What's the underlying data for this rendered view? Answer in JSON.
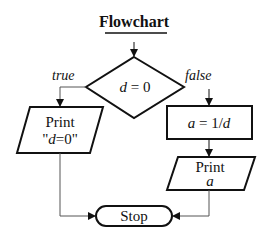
{
  "title": "Flowchart",
  "decision": {
    "expr_var": "d",
    "expr_rest": " = 0",
    "true_label": "true",
    "false_label": "false"
  },
  "left_branch": {
    "line1": "Print",
    "line2_open": "\"",
    "line2_var": "d",
    "line2_rest": "=0\""
  },
  "right_branch": {
    "process_var": "a",
    "process_eq": " = 1/",
    "process_var2": "d",
    "print_line1": "Print",
    "print_line2": "a"
  },
  "terminal": {
    "label": "Stop"
  },
  "colors": {
    "stroke": "#111111",
    "background": "#ffffff",
    "connector": "#555555"
  }
}
